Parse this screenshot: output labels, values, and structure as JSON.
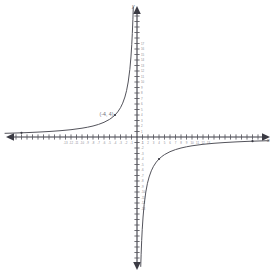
{
  "figure": {
    "kind": "coordinate-plane-graph",
    "background_color": "#ffffff",
    "axis_color": "#3b3b44",
    "curve_color": "#4a4a52",
    "tick_label_color": "#8d8d95",
    "point_label_color": "#6e6e77"
  },
  "axes": {
    "x_axis_label": "x",
    "y_axis_label": "y",
    "origin_px": {
      "x": 137,
      "y": 137
    },
    "unit_px": 5.5,
    "x_range": [
      -24,
      24
    ],
    "y_range": [
      -24,
      24
    ],
    "grid": "off",
    "x_tick_labels": [
      "-13",
      "-12",
      "-11",
      "-10",
      "-9",
      "-8",
      "-7",
      "-6",
      "-5",
      "-4",
      "-3",
      "-2",
      "-1",
      "1",
      "2",
      "3",
      "4",
      "5",
      "6",
      "7",
      "8",
      "9",
      "10",
      "11",
      "12",
      "13"
    ],
    "y_tick_labels": [
      "17",
      "16",
      "15",
      "14",
      "13",
      "12",
      "11",
      "10",
      "9",
      "8",
      "7",
      "6",
      "5",
      "4",
      "3",
      "2",
      "1",
      "-1",
      "-2",
      "-3",
      "-4",
      "-5",
      "-6",
      "-7",
      "-8",
      "-9",
      "-10",
      "-11",
      "-12",
      "-13"
    ]
  },
  "chart_data": {
    "type": "line",
    "title": "",
    "xlabel": "x",
    "ylabel": "y",
    "xlim": [
      -24,
      24
    ],
    "ylim": [
      -24,
      24
    ],
    "grid": false,
    "legend": "none",
    "series": [
      {
        "name": "branch-quadrant-II",
        "equation": "y = -16/x",
        "x": [
          -24,
          -22,
          -20,
          -18,
          -16,
          -14,
          -12,
          -10,
          -9,
          -8,
          -7,
          -6,
          -5,
          -4.5,
          -4,
          -3.5,
          -3,
          -2.6,
          -2.2,
          -1.9,
          -1.6,
          -1.3,
          -1.1,
          -0.95,
          -0.85,
          -0.75,
          -0.68
        ],
        "y": [
          0.67,
          0.73,
          0.8,
          0.89,
          1.0,
          1.14,
          1.33,
          1.6,
          1.78,
          2.0,
          2.29,
          2.67,
          3.2,
          3.56,
          4.0,
          4.57,
          5.33,
          6.15,
          7.27,
          8.42,
          10.0,
          12.31,
          14.55,
          16.84,
          18.82,
          21.33,
          23.53
        ]
      },
      {
        "name": "branch-quadrant-IV",
        "equation": "y = -16/x",
        "x": [
          0.68,
          0.75,
          0.85,
          0.95,
          1.1,
          1.3,
          1.6,
          1.9,
          2.2,
          2.6,
          3,
          3.5,
          4,
          4.5,
          5,
          6,
          7,
          8,
          9,
          10,
          12,
          14,
          16,
          18,
          20,
          22,
          24
        ],
        "y": [
          -23.53,
          -21.33,
          -18.82,
          -16.84,
          -14.55,
          -12.31,
          -10.0,
          -8.42,
          -7.27,
          -6.15,
          -5.33,
          -4.57,
          -4.0,
          -3.56,
          -3.2,
          -2.67,
          -2.29,
          -2.0,
          -1.78,
          -1.6,
          -1.33,
          -1.14,
          -1.0,
          -0.89,
          -0.8,
          -0.73,
          -0.67
        ]
      }
    ],
    "annotations": [
      {
        "label": "(-4, 4)",
        "x": -4,
        "y": 4,
        "marker": true
      }
    ],
    "markers": [
      {
        "x": -4,
        "y": 4
      },
      {
        "x": 4,
        "y": -4
      },
      {
        "x": -21,
        "y": 0.76
      },
      {
        "x": 21,
        "y": -0.76
      }
    ]
  },
  "point_label": {
    "text": "(-4, 4)"
  }
}
